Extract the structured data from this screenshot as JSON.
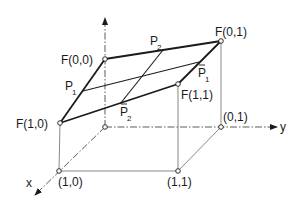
{
  "figure": {
    "type": "bilinear surface patch over unit square",
    "colors": {
      "ink": "#1a1a1a",
      "background": "#ffffff"
    }
  },
  "axes": {
    "x_label": "x",
    "y_label": "y",
    "z_arrow": true
  },
  "surface_corners": {
    "f00": "F(0,0)",
    "f01": "F(0,1)",
    "f10": "F(1,0)",
    "f11": "F(1,1)"
  },
  "floor_corners": {
    "c01": "(0,1)",
    "c10": "(1,0)",
    "c11": "(1,1)"
  },
  "boundary_points": {
    "p1": {
      "base": "P",
      "sub": "1",
      "bar": false
    },
    "p2": {
      "base": "P",
      "sub": "2",
      "bar": false
    },
    "p1bar": {
      "base": "P",
      "sub": "1",
      "bar": true
    },
    "p2bar": {
      "base": "P",
      "sub": "2",
      "bar": true
    }
  }
}
